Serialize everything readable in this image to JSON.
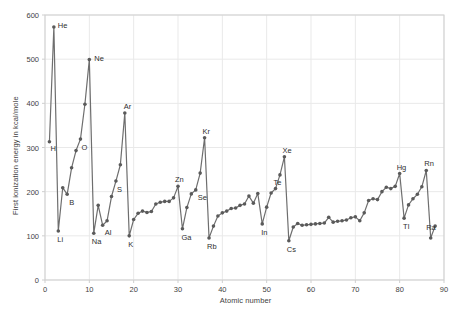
{
  "chart_data": {
    "type": "line",
    "title": "",
    "xlabel": "Atomic number",
    "ylabel": "First ionization energy in kcal/mole",
    "xlim": [
      0,
      90
    ],
    "ylim": [
      0,
      600
    ],
    "xticks": [
      0,
      10,
      20,
      30,
      40,
      50,
      60,
      70,
      80,
      90
    ],
    "yticks": [
      0,
      100,
      200,
      300,
      400,
      500,
      600
    ],
    "grid": true,
    "legend": "none",
    "marker": "circle",
    "line_color": "#6e6e6e",
    "marker_color": "#5a5a5a",
    "grid_color": "#e9e9e9",
    "axis_color": "#cfcfcf",
    "x": [
      1,
      2,
      3,
      4,
      5,
      6,
      7,
      8,
      9,
      10,
      11,
      12,
      13,
      14,
      15,
      16,
      17,
      18,
      19,
      20,
      21,
      22,
      23,
      24,
      25,
      26,
      27,
      28,
      29,
      30,
      31,
      32,
      33,
      34,
      35,
      36,
      37,
      38,
      39,
      40,
      41,
      42,
      43,
      44,
      45,
      46,
      47,
      48,
      49,
      50,
      51,
      52,
      53,
      54,
      55,
      56,
      57,
      58,
      59,
      60,
      61,
      62,
      63,
      64,
      65,
      66,
      67,
      68,
      69,
      70,
      71,
      72,
      73,
      74,
      75,
      76,
      77,
      78,
      79,
      80,
      81,
      82,
      83,
      84,
      85,
      86,
      87,
      88
    ],
    "y": [
      313,
      573,
      111,
      209,
      194,
      254,
      293,
      319,
      398,
      499,
      106,
      169,
      124,
      134,
      189,
      224,
      261,
      378,
      100,
      137,
      151,
      156,
      153,
      155,
      172,
      176,
      178,
      178,
      186,
      212,
      116,
      164,
      195,
      204,
      242,
      322,
      95,
      122,
      145,
      152,
      156,
      162,
      163,
      169,
      172,
      190,
      174,
      196,
      127,
      165,
      197,
      207,
      238,
      279,
      89,
      120,
      128,
      124,
      125,
      126,
      127,
      128,
      129,
      142,
      131,
      133,
      134,
      136,
      141,
      143,
      134,
      152,
      180,
      184,
      182,
      200,
      210,
      207,
      212,
      241,
      140,
      170,
      184,
      194,
      211,
      248,
      95,
      122
    ],
    "annotations": [
      {
        "element": "H",
        "atomic_number": 1,
        "value": 313
      },
      {
        "element": "He",
        "atomic_number": 2,
        "value": 573
      },
      {
        "element": "Li",
        "atomic_number": 3,
        "value": 111
      },
      {
        "element": "B",
        "atomic_number": 5,
        "value": 194
      },
      {
        "element": "O",
        "atomic_number": 8,
        "value": 319
      },
      {
        "element": "Ne",
        "atomic_number": 10,
        "value": 499
      },
      {
        "element": "Na",
        "atomic_number": 11,
        "value": 106
      },
      {
        "element": "Al",
        "atomic_number": 13,
        "value": 124
      },
      {
        "element": "S",
        "atomic_number": 16,
        "value": 224
      },
      {
        "element": "Ar",
        "atomic_number": 18,
        "value": 378
      },
      {
        "element": "K",
        "atomic_number": 19,
        "value": 100
      },
      {
        "element": "Zn",
        "atomic_number": 30,
        "value": 212
      },
      {
        "element": "Ga",
        "atomic_number": 31,
        "value": 116
      },
      {
        "element": "Se",
        "atomic_number": 34,
        "value": 204
      },
      {
        "element": "Kr",
        "atomic_number": 36,
        "value": 322
      },
      {
        "element": "Rb",
        "atomic_number": 37,
        "value": 95
      },
      {
        "element": "In",
        "atomic_number": 49,
        "value": 127
      },
      {
        "element": "Te",
        "atomic_number": 52,
        "value": 207
      },
      {
        "element": "Xe",
        "atomic_number": 54,
        "value": 279
      },
      {
        "element": "Cs",
        "atomic_number": 55,
        "value": 89
      },
      {
        "element": "Hg",
        "atomic_number": 80,
        "value": 241
      },
      {
        "element": "Tl",
        "atomic_number": 81,
        "value": 140
      },
      {
        "element": "Rn",
        "atomic_number": 86,
        "value": 248
      },
      {
        "element": "Ra",
        "atomic_number": 88,
        "value": 122
      }
    ],
    "label_offsets": {
      "H": {
        "dx": 1,
        "dy": 9
      },
      "He": {
        "dx": 4,
        "dy": 1
      },
      "Li": {
        "dx": -1,
        "dy": 11
      },
      "B": {
        "dx": 2,
        "dy": 11
      },
      "O": {
        "dx": 1,
        "dy": 11
      },
      "Ne": {
        "dx": 5,
        "dy": 1
      },
      "Na": {
        "dx": -2,
        "dy": 11
      },
      "Al": {
        "dx": 2,
        "dy": 10
      },
      "S": {
        "dx": 1,
        "dy": 11
      },
      "Ar": {
        "dx": -1,
        "dy": -4
      },
      "K": {
        "dx": -1,
        "dy": 11
      },
      "Zn": {
        "dx": -3,
        "dy": -4
      },
      "Ga": {
        "dx": -1,
        "dy": 11
      },
      "Se": {
        "dx": 2,
        "dy": 10
      },
      "Kr": {
        "dx": -2,
        "dy": -4
      },
      "Rb": {
        "dx": -2,
        "dy": 11
      },
      "In": {
        "dx": -1,
        "dy": 11
      },
      "Te": {
        "dx": -2,
        "dy": -4
      },
      "Xe": {
        "dx": -2,
        "dy": -4
      },
      "Cs": {
        "dx": -2,
        "dy": 11
      },
      "Hg": {
        "dx": -3,
        "dy": -4
      },
      "Tl": {
        "dx": -1,
        "dy": 11
      },
      "Rn": {
        "dx": -2,
        "dy": -4
      },
      "Ra": {
        "dx": -9,
        "dy": 4
      }
    }
  }
}
